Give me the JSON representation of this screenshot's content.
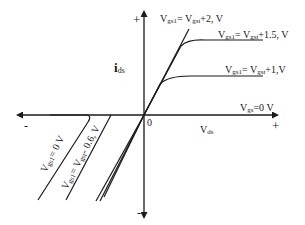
{
  "diagram": {
    "axes": {
      "y_label_main": "i",
      "y_label_sub": "ds",
      "x_label_main": "V",
      "x_label_sub": "ds",
      "origin_label": "0",
      "y_plus": "+",
      "y_minus": "-",
      "x_plus": "+",
      "x_minus": "-"
    },
    "curves": [
      {
        "main": "V",
        "sub": "gs1",
        "rest": "= V",
        "sub2": "gst",
        "tail": "+2, V"
      },
      {
        "main": "V",
        "sub": "gs1",
        "rest": "= V",
        "sub2": "gst",
        "tail": "+1.5, V"
      },
      {
        "main": "V",
        "sub": "gs1",
        "rest": "= V",
        "sub2": "gst",
        "tail": "+1,V"
      },
      {
        "main": "V",
        "sub": "gs",
        "rest": "=0 V",
        "sub2": "",
        "tail": ""
      }
    ],
    "reverse_curves": [
      {
        "main": "V",
        "sub": "gs1",
        "rest": "= 0 V"
      },
      {
        "main": "V",
        "sub": "gs1",
        "rest": "= V",
        "sub2": "gst",
        "tail": "- 0.6, V"
      }
    ],
    "colors": {
      "line": "#1a1a1a",
      "background": "#ffffff"
    }
  }
}
